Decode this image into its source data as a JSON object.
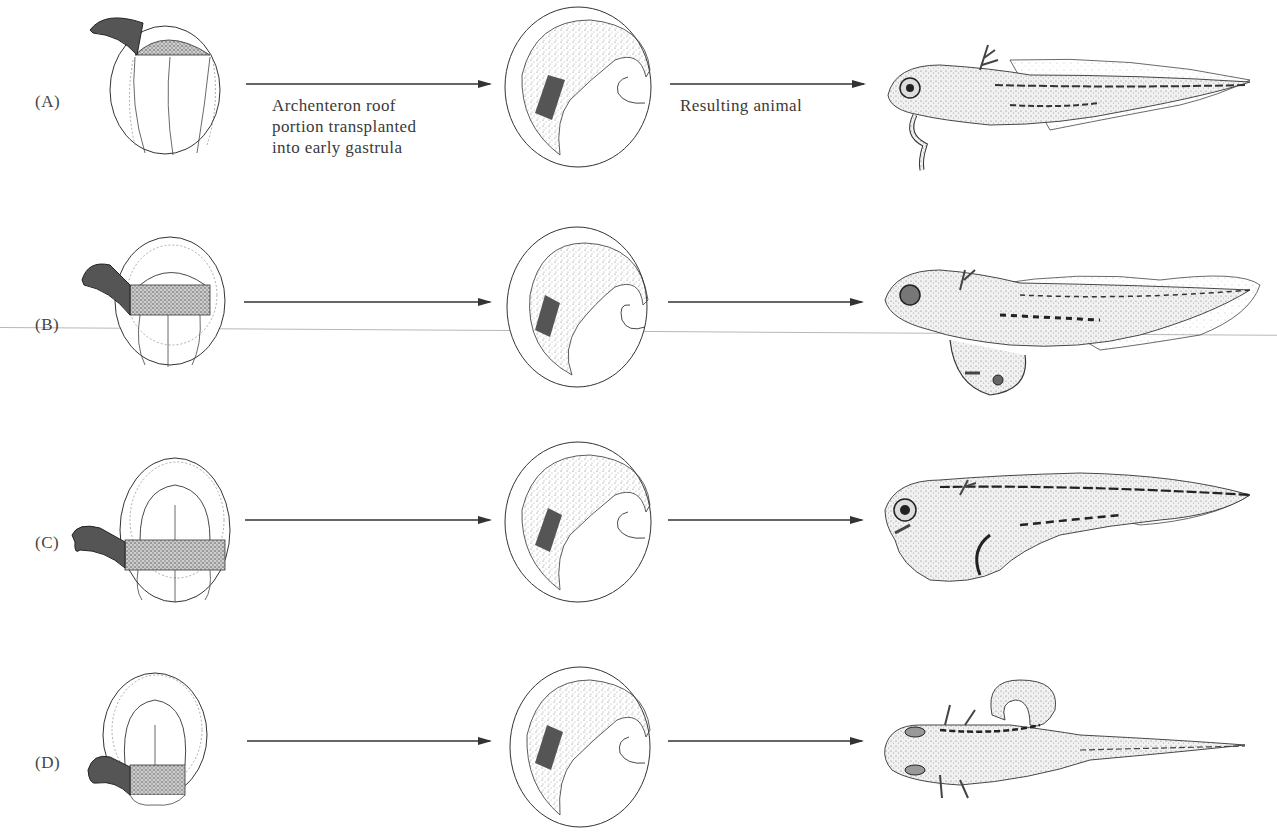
{
  "figure": {
    "rows": [
      {
        "label": "(A)",
        "donor_region": "archenteron roof - anterior (head) portion",
        "arrow1_caption": [
          "Archenteron roof",
          "portion transplanted",
          "into early gastrula"
        ],
        "arrow2_caption": "Resulting animal",
        "result": "secondary head structures with balancers"
      },
      {
        "label": "(B)",
        "donor_region": "archenteron roof - anterior-middle portion",
        "arrow1_caption": [],
        "arrow2_caption": "",
        "result": "secondary head with eye"
      },
      {
        "label": "(C)",
        "donor_region": "archenteron roof - middle portion",
        "arrow1_caption": [],
        "arrow2_caption": "",
        "result": "secondary trunk"
      },
      {
        "label": "(D)",
        "donor_region": "archenteron roof - posterior portion",
        "arrow1_caption": [],
        "arrow2_caption": "",
        "result": "secondary trunk and tail"
      }
    ],
    "colors": {
      "graft": "#555555",
      "stipple": "#8a8a8a",
      "line": "#333333",
      "scan_line": "#b8b8b8"
    }
  }
}
